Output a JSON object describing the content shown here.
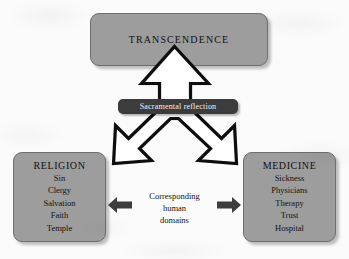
{
  "diagram": {
    "title_node": {
      "label": "TRANSCENDENCE"
    },
    "banner": {
      "label": "Sacramental reflection"
    },
    "center": {
      "line1": "Corresponding",
      "line2": "human",
      "line3": "domains"
    },
    "left_node": {
      "title": "RELIGION",
      "items": [
        "Sin",
        "Clergy",
        "Salvation",
        "Faith",
        "Temple"
      ]
    },
    "right_node": {
      "title": "MEDICINE",
      "items": [
        "Sickness",
        "Physicians",
        "Therapy",
        "Trust",
        "Hospital"
      ]
    },
    "colors": {
      "node_fill": "#9d9d9d",
      "node_border": "#6f6f6f",
      "banner_fill": "#3c3c3c",
      "banner_text": "#f2f2f2",
      "arrow_outline": "#111111",
      "arrow_fill": "#ffffff",
      "small_arrow_fill": "#3d3d3d",
      "background": "#fbfbfb"
    }
  }
}
